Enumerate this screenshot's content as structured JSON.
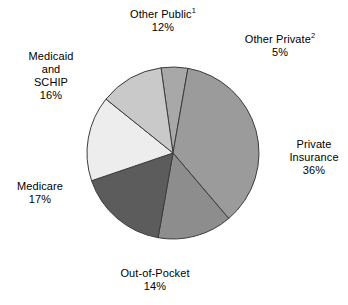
{
  "chart_data": {
    "type": "pie",
    "title": "",
    "subtitle": "",
    "xlabel": "",
    "ylabel": "",
    "legend_position": "none",
    "grid": false,
    "labels_outside": true,
    "start_angle_deg": -8,
    "direction": "clockwise",
    "categories": [
      "Other Private",
      "Private Insurance",
      "Out-of-Pocket",
      "Medicare",
      "Medicaid and SCHIP",
      "Other Public"
    ],
    "values": [
      5,
      36,
      14,
      17,
      16,
      12
    ],
    "unit": "percent",
    "total": 100,
    "slices": [
      {
        "key": "other-private",
        "name": "Other Private",
        "name_lines": [
          "Other Private"
        ],
        "footnote": "2",
        "value": 5,
        "value_label": "5%",
        "color": "#a8a8a8"
      },
      {
        "key": "private-insurance",
        "name": "Private Insurance",
        "name_lines": [
          "Private",
          "Insurance"
        ],
        "footnote": "",
        "value": 36,
        "value_label": "36%",
        "color": "#9b9b9b"
      },
      {
        "key": "out-of-pocket",
        "name": "Out-of-Pocket",
        "name_lines": [
          "Out-of-Pocket"
        ],
        "footnote": "",
        "value": 14,
        "value_label": "14%",
        "color": "#8d8d8d"
      },
      {
        "key": "medicare",
        "name": "Medicare",
        "name_lines": [
          "Medicare"
        ],
        "footnote": "",
        "value": 17,
        "value_label": "17%",
        "color": "#5c5c5c"
      },
      {
        "key": "medicaid-schip",
        "name": "Medicaid and SCHIP",
        "name_lines": [
          "Medicaid",
          "and",
          "SCHIP"
        ],
        "footnote": "",
        "value": 16,
        "value_label": "16%",
        "color": "#ededed"
      },
      {
        "key": "other-public",
        "name": "Other Public",
        "name_lines": [
          "Other Public"
        ],
        "footnote": "1",
        "value": 12,
        "value_label": "12%",
        "color": "#c9c9c9"
      }
    ],
    "geometry": {
      "center_x": 173,
      "center_y": 153,
      "radius": 86,
      "stroke_color": "#3c3c3c",
      "stroke_width": 1
    }
  },
  "labels": {
    "other_public": {
      "name": "Other Public",
      "footnote": "1",
      "value": "12%"
    },
    "other_private": {
      "name": "Other Private",
      "footnote": "2",
      "value": "5%"
    },
    "private_insurance": {
      "line1": "Private",
      "line2": "Insurance",
      "value": "36%"
    },
    "out_of_pocket": {
      "name": "Out-of-Pocket",
      "value": "14%"
    },
    "medicare": {
      "name": "Medicare",
      "value": "17%"
    },
    "medicaid_schip": {
      "line1": "Medicaid",
      "line2": "and",
      "line3": "SCHIP",
      "value": "16%"
    }
  }
}
